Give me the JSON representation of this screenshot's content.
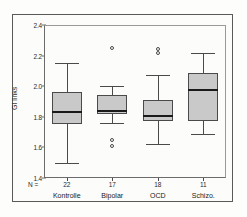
{
  "figure": {
    "y_axis_label": "GI links",
    "n_prefix": "N ="
  },
  "chart_data": {
    "type": "box",
    "title": "",
    "xlabel": "",
    "ylabel": "GI links",
    "ylim": [
      1.4,
      2.4
    ],
    "yticks": [
      "1.4",
      "1.6",
      "1.8",
      "2.0",
      "2.2",
      "2.4"
    ],
    "ytick_values": [
      1.4,
      1.6,
      1.8,
      2.0,
      2.2,
      2.4
    ],
    "grid": false,
    "legend": "none",
    "categories": [
      "Kontrolle",
      "Bipolar",
      "OCD",
      "Schizo."
    ],
    "counts": [
      22,
      17,
      18,
      11
    ],
    "boxes": [
      {
        "name": "Kontrolle",
        "n": 22,
        "whisker_low": 1.5,
        "q1": 1.755,
        "median": 1.835,
        "q3": 1.965,
        "whisker_high": 2.15,
        "outliers": []
      },
      {
        "name": "Bipolar",
        "n": 17,
        "whisker_low": 1.76,
        "q1": 1.82,
        "median": 1.845,
        "q3": 1.94,
        "whisker_high": 2.0,
        "outliers": [
          2.25,
          1.65,
          1.61
        ]
      },
      {
        "name": "OCD",
        "n": 18,
        "whisker_low": 1.62,
        "q1": 1.775,
        "median": 1.815,
        "q3": 1.91,
        "whisker_high": 2.07,
        "outliers": [
          2.245,
          2.215
        ]
      },
      {
        "name": "Schizo.",
        "n": 11,
        "whisker_low": 1.685,
        "q1": 1.77,
        "median": 1.98,
        "q3": 2.085,
        "whisker_high": 2.22,
        "outliers": []
      }
    ]
  },
  "colors": {
    "box_fill": "#c9c9c9",
    "box_stroke": "#4a4a4a",
    "median": "#1a1a1a",
    "axis": "#6b6b6b",
    "background": "#fcfcfa"
  }
}
